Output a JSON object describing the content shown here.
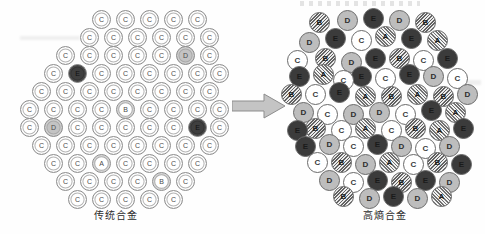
{
  "figure": {
    "type": "diagram",
    "arrow": {
      "name": "transformation-arrow",
      "direction": "right"
    }
  },
  "panels": {
    "left": {
      "caption": "传统合金",
      "structure": "ordered-hexagonal-lattice",
      "majority_species": "C",
      "atoms": [
        {
          "s": "C",
          "x": 92,
          "y": 10
        },
        {
          "s": "C",
          "x": 116,
          "y": 10
        },
        {
          "s": "C",
          "x": 140,
          "y": 10
        },
        {
          "s": "C",
          "x": 164,
          "y": 10
        },
        {
          "s": "C",
          "x": 188,
          "y": 10
        },
        {
          "s": "C",
          "x": 80,
          "y": 28
        },
        {
          "s": "C",
          "x": 104,
          "y": 28
        },
        {
          "s": "C",
          "x": 128,
          "y": 28
        },
        {
          "s": "C",
          "x": 152,
          "y": 28
        },
        {
          "s": "C",
          "x": 176,
          "y": 28
        },
        {
          "s": "C",
          "x": 200,
          "y": 28
        },
        {
          "s": "C",
          "x": 56,
          "y": 46
        },
        {
          "s": "C",
          "x": 80,
          "y": 46
        },
        {
          "s": "C",
          "x": 104,
          "y": 46
        },
        {
          "s": "C",
          "x": 128,
          "y": 46
        },
        {
          "s": "C",
          "x": 152,
          "y": 46
        },
        {
          "s": "D",
          "x": 176,
          "y": 46
        },
        {
          "s": "C",
          "x": 200,
          "y": 46
        },
        {
          "s": "C",
          "x": 44,
          "y": 64
        },
        {
          "s": "E",
          "x": 68,
          "y": 64
        },
        {
          "s": "C",
          "x": 92,
          "y": 64
        },
        {
          "s": "C",
          "x": 116,
          "y": 64
        },
        {
          "s": "C",
          "x": 140,
          "y": 64
        },
        {
          "s": "C",
          "x": 164,
          "y": 64
        },
        {
          "s": "C",
          "x": 188,
          "y": 64
        },
        {
          "s": "C",
          "x": 210,
          "y": 64
        },
        {
          "s": "C",
          "x": 32,
          "y": 82
        },
        {
          "s": "C",
          "x": 56,
          "y": 82
        },
        {
          "s": "C",
          "x": 80,
          "y": 82
        },
        {
          "s": "C",
          "x": 104,
          "y": 82
        },
        {
          "s": "C",
          "x": 128,
          "y": 82
        },
        {
          "s": "C",
          "x": 152,
          "y": 82
        },
        {
          "s": "C",
          "x": 176,
          "y": 82
        },
        {
          "s": "C",
          "x": 200,
          "y": 82
        },
        {
          "s": "C",
          "x": 20,
          "y": 100
        },
        {
          "s": "C",
          "x": 44,
          "y": 100
        },
        {
          "s": "C",
          "x": 68,
          "y": 100
        },
        {
          "s": "C",
          "x": 92,
          "y": 100
        },
        {
          "s": "B",
          "x": 116,
          "y": 100
        },
        {
          "s": "C",
          "x": 140,
          "y": 100
        },
        {
          "s": "C",
          "x": 164,
          "y": 100
        },
        {
          "s": "C",
          "x": 188,
          "y": 100
        },
        {
          "s": "C",
          "x": 210,
          "y": 100
        },
        {
          "s": "C",
          "x": 20,
          "y": 118
        },
        {
          "s": "D",
          "x": 44,
          "y": 118
        },
        {
          "s": "C",
          "x": 68,
          "y": 118
        },
        {
          "s": "C",
          "x": 92,
          "y": 118
        },
        {
          "s": "C",
          "x": 116,
          "y": 118
        },
        {
          "s": "C",
          "x": 140,
          "y": 118
        },
        {
          "s": "C",
          "x": 164,
          "y": 118
        },
        {
          "s": "E",
          "x": 188,
          "y": 118
        },
        {
          "s": "C",
          "x": 210,
          "y": 118
        },
        {
          "s": "C",
          "x": 32,
          "y": 136
        },
        {
          "s": "C",
          "x": 56,
          "y": 136
        },
        {
          "s": "C",
          "x": 80,
          "y": 136
        },
        {
          "s": "C",
          "x": 104,
          "y": 136
        },
        {
          "s": "C",
          "x": 128,
          "y": 136
        },
        {
          "s": "C",
          "x": 152,
          "y": 136
        },
        {
          "s": "C",
          "x": 176,
          "y": 136
        },
        {
          "s": "C",
          "x": 200,
          "y": 136
        },
        {
          "s": "C",
          "x": 44,
          "y": 154
        },
        {
          "s": "C",
          "x": 68,
          "y": 154
        },
        {
          "s": "A",
          "x": 92,
          "y": 154
        },
        {
          "s": "C",
          "x": 116,
          "y": 154
        },
        {
          "s": "C",
          "x": 140,
          "y": 154
        },
        {
          "s": "C",
          "x": 164,
          "y": 154
        },
        {
          "s": "C",
          "x": 188,
          "y": 154
        },
        {
          "s": "C",
          "x": 56,
          "y": 172
        },
        {
          "s": "C",
          "x": 80,
          "y": 172
        },
        {
          "s": "C",
          "x": 104,
          "y": 172
        },
        {
          "s": "C",
          "x": 128,
          "y": 172
        },
        {
          "s": "B",
          "x": 152,
          "y": 172
        },
        {
          "s": "C",
          "x": 176,
          "y": 172
        },
        {
          "s": "C",
          "x": 68,
          "y": 190
        },
        {
          "s": "C",
          "x": 92,
          "y": 190
        },
        {
          "s": "C",
          "x": 116,
          "y": 190
        },
        {
          "s": "C",
          "x": 140,
          "y": 190
        },
        {
          "s": "C",
          "x": 164,
          "y": 190
        }
      ]
    },
    "right": {
      "caption": "高熵合金",
      "structure": "random-solid-solution",
      "majority_species": null,
      "atoms": [
        {
          "s": "B",
          "x": 24,
          "y": 12
        },
        {
          "s": "D",
          "x": 52,
          "y": 10
        },
        {
          "s": "E",
          "x": 78,
          "y": 8
        },
        {
          "s": "D",
          "x": 104,
          "y": 10
        },
        {
          "s": "B",
          "x": 130,
          "y": 12
        },
        {
          "s": "E",
          "x": 40,
          "y": 28
        },
        {
          "s": "C",
          "x": 66,
          "y": 30
        },
        {
          "s": "A",
          "x": 90,
          "y": 26
        },
        {
          "s": "E",
          "x": 116,
          "y": 28
        },
        {
          "s": "A",
          "x": 142,
          "y": 30
        },
        {
          "s": "D",
          "x": 14,
          "y": 32
        },
        {
          "s": "C",
          "x": 2,
          "y": 50
        },
        {
          "s": "B",
          "x": 30,
          "y": 48
        },
        {
          "s": "D",
          "x": 56,
          "y": 52
        },
        {
          "s": "E",
          "x": 80,
          "y": 48
        },
        {
          "s": "B",
          "x": 104,
          "y": 48
        },
        {
          "s": "C",
          "x": 128,
          "y": 50
        },
        {
          "s": "E",
          "x": 152,
          "y": 48
        },
        {
          "s": "E",
          "x": 4,
          "y": 66
        },
        {
          "s": "A",
          "x": 28,
          "y": 64
        },
        {
          "s": "E",
          "x": 66,
          "y": 66
        },
        {
          "s": "C",
          "x": 90,
          "y": 68
        },
        {
          "s": "E",
          "x": 114,
          "y": 64
        },
        {
          "s": "D",
          "x": 138,
          "y": 66
        },
        {
          "s": "C",
          "x": 162,
          "y": 68
        },
        {
          "s": "C",
          "x": 48,
          "y": 70
        },
        {
          "s": "B",
          "x": -4,
          "y": 84
        },
        {
          "s": "C",
          "x": 20,
          "y": 84
        },
        {
          "s": "E",
          "x": 44,
          "y": 82
        },
        {
          "s": "A",
          "x": 70,
          "y": 86
        },
        {
          "s": "B",
          "x": 96,
          "y": 86
        },
        {
          "s": "A",
          "x": 122,
          "y": 84
        },
        {
          "s": "B",
          "x": 148,
          "y": 86
        },
        {
          "s": "D",
          "x": 172,
          "y": 84
        },
        {
          "s": "D",
          "x": 8,
          "y": 102
        },
        {
          "s": "C",
          "x": 32,
          "y": 104
        },
        {
          "s": "D",
          "x": 58,
          "y": 104
        },
        {
          "s": "D",
          "x": 84,
          "y": 102
        },
        {
          "s": "C",
          "x": 110,
          "y": 104
        },
        {
          "s": "E",
          "x": 136,
          "y": 100
        },
        {
          "s": "A",
          "x": 160,
          "y": 102
        },
        {
          "s": "B",
          "x": 20,
          "y": 118
        },
        {
          "s": "C",
          "x": 46,
          "y": 120
        },
        {
          "s": "E",
          "x": 2,
          "y": 120
        },
        {
          "s": "A",
          "x": 70,
          "y": 118
        },
        {
          "s": "C",
          "x": 96,
          "y": 120
        },
        {
          "s": "B",
          "x": 120,
          "y": 118
        },
        {
          "s": "A",
          "x": 144,
          "y": 120
        },
        {
          "s": "E",
          "x": 168,
          "y": 118
        },
        {
          "s": "E",
          "x": 10,
          "y": 136
        },
        {
          "s": "D",
          "x": 34,
          "y": 134
        },
        {
          "s": "C",
          "x": 58,
          "y": 136
        },
        {
          "s": "E",
          "x": 82,
          "y": 134
        },
        {
          "s": "D",
          "x": 106,
          "y": 136
        },
        {
          "s": "C",
          "x": 130,
          "y": 138
        },
        {
          "s": "D",
          "x": 154,
          "y": 136
        },
        {
          "s": "C",
          "x": 22,
          "y": 152
        },
        {
          "s": "B",
          "x": 46,
          "y": 152
        },
        {
          "s": "D",
          "x": 70,
          "y": 154
        },
        {
          "s": "A",
          "x": 94,
          "y": 152
        },
        {
          "s": "C",
          "x": 118,
          "y": 154
        },
        {
          "s": "B",
          "x": 142,
          "y": 152
        },
        {
          "s": "E",
          "x": 166,
          "y": 154
        },
        {
          "s": "D",
          "x": 34,
          "y": 170
        },
        {
          "s": "C",
          "x": 58,
          "y": 172
        },
        {
          "s": "E",
          "x": 82,
          "y": 170
        },
        {
          "s": "B",
          "x": 106,
          "y": 172
        },
        {
          "s": "E",
          "x": 130,
          "y": 170
        },
        {
          "s": "D",
          "x": 154,
          "y": 172
        },
        {
          "s": "B",
          "x": 48,
          "y": 186
        },
        {
          "s": "D",
          "x": 74,
          "y": 188
        },
        {
          "s": "E",
          "x": 98,
          "y": 186
        },
        {
          "s": "D",
          "x": 122,
          "y": 188
        },
        {
          "s": "A",
          "x": 146,
          "y": 186
        }
      ]
    }
  },
  "species_legend": {
    "A": "#a8a8a8",
    "B": "#9c9c9c",
    "C": "#ffffff",
    "D": "#bdbdbd",
    "E": "#3b3b3b"
  }
}
